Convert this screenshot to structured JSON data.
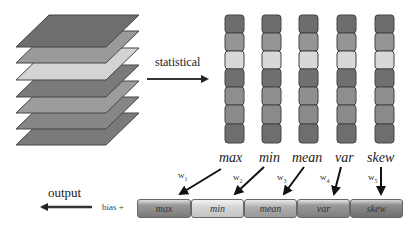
{
  "diagram": {
    "arrow_label": "statistical",
    "output_label": "output",
    "bias_label": "bias +",
    "statistics": [
      {
        "name": "max",
        "weight": "w",
        "weight_sub": "1",
        "color": "#8c8c8c"
      },
      {
        "name": "min",
        "weight": "w",
        "weight_sub": "2",
        "color": "#d6d6d6"
      },
      {
        "name": "mean",
        "weight": "w",
        "weight_sub": "3",
        "color": "#a8a8a8"
      },
      {
        "name": "var",
        "weight": "w",
        "weight_sub": "4",
        "color": "#8a8a8a"
      },
      {
        "name": "skew",
        "weight": "w",
        "weight_sub": "5",
        "color": "#7e7e7e"
      }
    ],
    "layer_colors": [
      "#6e6e6e",
      "#9a9a9a",
      "#d4d4d4",
      "#7a7a7a",
      "#9c9c9c",
      "#868686",
      "#7a7a7a"
    ],
    "column_cell_colors": [
      "#6d6d6d",
      "#959595",
      "#d8d8d8",
      "#707070",
      "#8f8f8f",
      "#8a8a8a",
      "#6e6e6e"
    ]
  }
}
